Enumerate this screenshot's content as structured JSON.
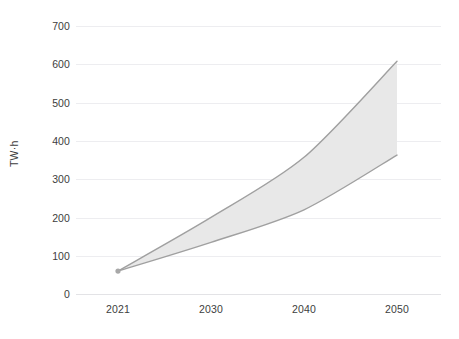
{
  "chart_data": {
    "type": "area",
    "title": "",
    "subtitle": "",
    "xlabel": "",
    "ylabel": "TW·h",
    "x": [
      2021,
      2030,
      2040,
      2050
    ],
    "categories": [
      "2021",
      "2030",
      "2040",
      "2050"
    ],
    "xtick_labels": [
      "2021",
      "2030",
      "2040",
      "2050"
    ],
    "ytick_labels": [
      "0",
      "100",
      "200",
      "300",
      "400",
      "500",
      "600",
      "700"
    ],
    "ytick_values": [
      0,
      100,
      200,
      300,
      400,
      500,
      600,
      700
    ],
    "ylim": [
      0,
      700
    ],
    "xlim": [
      2021,
      2050
    ],
    "grid": true,
    "legend": false,
    "legend_position": "none",
    "band_fill_color": "#e8e8e8",
    "band_line_color": "#a0a0a0",
    "grid_color": "#ededf0",
    "text_color": "#3d3d3d",
    "background_color": "#ffffff",
    "series": [
      {
        "name": "High scenario",
        "role": "upper-bound",
        "values": [
          60,
          200,
          357,
          608
        ]
      },
      {
        "name": "Low scenario",
        "role": "lower-bound",
        "values": [
          60,
          135,
          220,
          363
        ]
      }
    ],
    "annotations": [],
    "marker_points": [
      {
        "x": 2021,
        "y": 60
      }
    ]
  },
  "axis": {
    "y_title": "TW·h"
  }
}
